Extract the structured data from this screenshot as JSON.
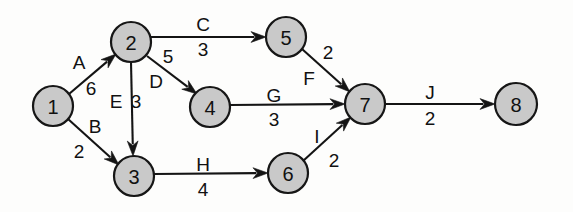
{
  "diagram": {
    "type": "directed-graph",
    "background_color": "#fdfdfc",
    "node_fill_color": "#c9c9c9",
    "node_stroke_color": "#161616",
    "edge_color": "#141414",
    "text_color": "#111111",
    "nodes": [
      {
        "id": "1",
        "label": "1",
        "cx": 53,
        "cy": 106,
        "r": 20
      },
      {
        "id": "2",
        "label": "2",
        "cx": 131,
        "cy": 42,
        "r": 20
      },
      {
        "id": "3",
        "label": "3",
        "cx": 134,
        "cy": 176,
        "r": 20
      },
      {
        "id": "4",
        "label": "4",
        "cx": 210,
        "cy": 107,
        "r": 20
      },
      {
        "id": "5",
        "label": "5",
        "cx": 286,
        "cy": 37,
        "r": 20
      },
      {
        "id": "6",
        "label": "6",
        "cx": 288,
        "cy": 173,
        "r": 20
      },
      {
        "id": "7",
        "label": "7",
        "cx": 365,
        "cy": 104,
        "r": 20
      },
      {
        "id": "8",
        "label": "8",
        "cx": 516,
        "cy": 104,
        "r": 21
      }
    ],
    "edges": [
      {
        "id": "A",
        "from": "1",
        "to": "2",
        "name": "A",
        "weight": "6",
        "name_x": 79,
        "name_y": 62,
        "weight_x": 91,
        "weight_y": 88
      },
      {
        "id": "B",
        "from": "1",
        "to": "3",
        "name": "B",
        "weight": "2",
        "name_x": 95,
        "name_y": 126,
        "weight_x": 79,
        "weight_y": 151
      },
      {
        "id": "C",
        "from": "2",
        "to": "5",
        "name": "C",
        "weight": "3",
        "name_x": 203,
        "name_y": 24,
        "weight_x": 203,
        "weight_y": 49
      },
      {
        "id": "D",
        "from": "2",
        "to": "4",
        "name": "D",
        "weight": "5",
        "name_x": 156,
        "name_y": 81,
        "weight_x": 168,
        "weight_y": 56
      },
      {
        "id": "E",
        "from": "2",
        "to": "3",
        "name": "E",
        "weight": "3",
        "name_x": 116,
        "name_y": 101,
        "weight_x": 136,
        "weight_y": 101
      },
      {
        "id": "F",
        "from": "5",
        "to": "7",
        "name": "F",
        "weight": "2",
        "name_x": 309,
        "name_y": 78,
        "weight_x": 328,
        "weight_y": 52
      },
      {
        "id": "G",
        "from": "4",
        "to": "7",
        "name": "G",
        "weight": "3",
        "name_x": 274,
        "name_y": 95,
        "weight_x": 274,
        "weight_y": 119
      },
      {
        "id": "H",
        "from": "3",
        "to": "6",
        "name": "H",
        "weight": "4",
        "name_x": 203,
        "name_y": 164,
        "weight_x": 203,
        "weight_y": 189
      },
      {
        "id": "I",
        "from": "6",
        "to": "7",
        "name": "I",
        "weight": "2",
        "name_x": 317,
        "name_y": 136,
        "weight_x": 334,
        "weight_y": 160
      },
      {
        "id": "J",
        "from": "7",
        "to": "8",
        "name": "J",
        "weight": "2",
        "name_x": 430,
        "name_y": 92,
        "weight_x": 430,
        "weight_y": 118
      }
    ],
    "edge_geometry": [
      {
        "id": "A",
        "x1": 69,
        "y1": 94,
        "x2": 116,
        "y2": 54
      },
      {
        "id": "B",
        "x1": 68,
        "y1": 119,
        "x2": 119,
        "y2": 165
      },
      {
        "id": "C",
        "x1": 151,
        "y1": 37,
        "x2": 266,
        "y2": 37
      },
      {
        "id": "D",
        "x1": 147,
        "y1": 56,
        "x2": 197,
        "y2": 94
      },
      {
        "id": "E",
        "x1": 131,
        "y1": 62,
        "x2": 133,
        "y2": 156
      },
      {
        "id": "F",
        "x1": 302,
        "y1": 49,
        "x2": 350,
        "y2": 92
      },
      {
        "id": "G",
        "x1": 230,
        "y1": 105,
        "x2": 345,
        "y2": 104
      },
      {
        "id": "H",
        "x1": 154,
        "y1": 174,
        "x2": 268,
        "y2": 173
      },
      {
        "id": "I",
        "x1": 303,
        "y1": 161,
        "x2": 351,
        "y2": 117
      },
      {
        "id": "J",
        "x1": 385,
        "y1": 104,
        "x2": 495,
        "y2": 104
      }
    ]
  }
}
